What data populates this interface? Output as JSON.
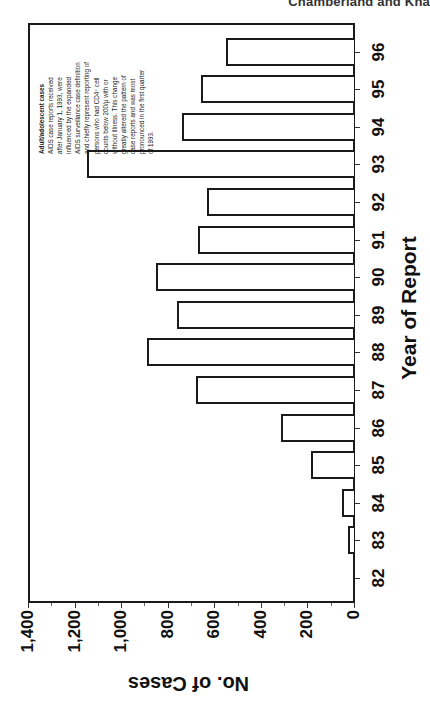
{
  "header": {
    "running_head": "Chamberland and Kha"
  },
  "annotation": {
    "title": "Adult/adolescent cases",
    "lines": [
      "AIDS case reports received",
      "after January 1, 1993, were",
      "influenced by the expanded",
      "AIDS surveillance case definition",
      "and chiefly represent reporting of",
      "persons who had CD4⁺ cell",
      "counts below 200/µ with or",
      "without illness. This change",
      "greatly altered the pattern of",
      "case reports and was most",
      "pronounced in the first quarter",
      "of 1993."
    ]
  },
  "axes": {
    "x_title": "Year of Report",
    "y_title": "No. of Cases",
    "year_labels": [
      "82",
      "83",
      "84",
      "85",
      "86",
      "87",
      "88",
      "89",
      "90",
      "91",
      "92",
      "93",
      "94",
      "95",
      "96"
    ],
    "value_labels": [
      "0",
      "200",
      "400",
      "600",
      "800",
      "1,000",
      "1,200",
      "1,400"
    ]
  },
  "chart_data": {
    "type": "bar",
    "orientation": "rotated 90° (bars drawn horizontally, page printed sideways)",
    "title": "",
    "xlabel": "Year of Report",
    "ylabel": "No. of Cases",
    "categories": [
      "82",
      "83",
      "84",
      "85",
      "86",
      "87",
      "88",
      "89",
      "90",
      "91",
      "92",
      "93",
      "94",
      "95",
      "96"
    ],
    "values": [
      0,
      25,
      50,
      185,
      315,
      680,
      890,
      760,
      850,
      670,
      630,
      1145,
      740,
      655,
      550
    ],
    "ylim": [
      0,
      1400
    ],
    "yticks": [
      0,
      200,
      400,
      600,
      800,
      1000,
      1200,
      1400
    ],
    "grid": false,
    "legend": null,
    "annotations": [
      "Adult/adolescent cases — AIDS case reports received after January 1, 1993, were influenced by the expanded AIDS surveillance case definition and chiefly represent reporting of persons who had CD4+ cell counts below 200/µ with or without illness. This change greatly altered the pattern of case reports and was most pronounced in the first quarter of 1993."
    ]
  }
}
